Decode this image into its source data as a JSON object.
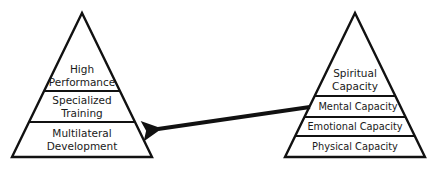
{
  "diagram": {
    "left_pyramid": {
      "name": "Athletic development pyramid",
      "tiers": [
        {
          "line1": "High",
          "line2": "Performance"
        },
        {
          "line1": "Specialized",
          "line2": "Training"
        },
        {
          "line1": "Multilateral",
          "line2": "Development"
        }
      ]
    },
    "right_pyramid": {
      "name": "Capacity pyramid",
      "tiers": [
        {
          "line1": "Spiritual",
          "line2": "Capacity"
        },
        {
          "line1": "Mental Capacity"
        },
        {
          "line1": "Emotional Capacity"
        },
        {
          "line1": "Physical Capacity"
        }
      ]
    },
    "arrow": {
      "from": "Mental Capacity",
      "to": "Multilateral Development"
    },
    "colors": {
      "stroke": "#111111",
      "text": "#1a1a1a",
      "background": "#ffffff"
    }
  }
}
